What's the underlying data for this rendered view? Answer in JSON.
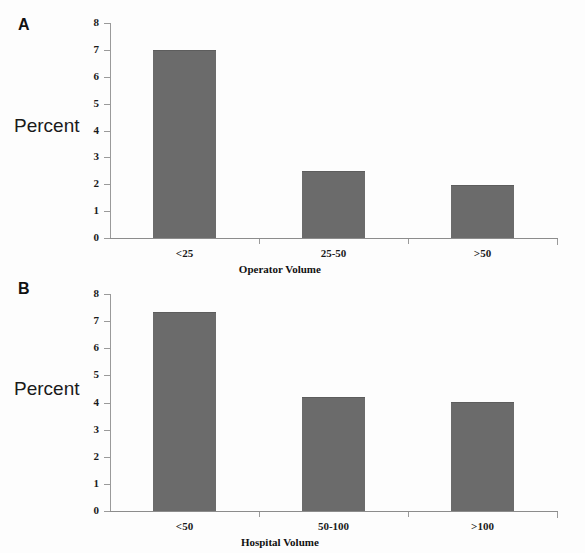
{
  "figure": {
    "panels": [
      {
        "letter": "A",
        "ylabel": "Percent",
        "xlabel": "Operator Volume",
        "yticks": [
          "0",
          "1",
          "2",
          "3",
          "4",
          "5",
          "6",
          "7",
          "8"
        ],
        "categories": [
          "<25",
          "25-50",
          ">50"
        ],
        "values": [
          6.95,
          2.45,
          1.93
        ]
      },
      {
        "letter": "B",
        "ylabel": "Percent",
        "xlabel": "Hospital Volume",
        "yticks": [
          "0",
          "1",
          "2",
          "3",
          "4",
          "5",
          "6",
          "7",
          "8"
        ],
        "categories": [
          "<50",
          "50-100",
          ">100"
        ],
        "values": [
          7.3,
          4.15,
          4.0
        ]
      }
    ],
    "bar_color": "#6b6b6b",
    "axis_color": "#9a9a9a"
  },
  "chart_data": [
    {
      "type": "bar",
      "title": "A",
      "categories": [
        "<25",
        "25-50",
        ">50"
      ],
      "values": [
        6.95,
        2.45,
        1.93
      ],
      "xlabel": "Operator Volume",
      "ylabel": "Percent",
      "ylim": [
        0,
        8
      ],
      "ytick_values": [
        0,
        1,
        2,
        3,
        4,
        5,
        6,
        7,
        8
      ],
      "grid": false,
      "legend": "none",
      "series": [
        {
          "name": "Percent",
          "values": [
            6.95,
            2.45,
            1.93
          ]
        }
      ]
    },
    {
      "type": "bar",
      "title": "B",
      "categories": [
        "<50",
        "50-100",
        ">100"
      ],
      "values": [
        7.3,
        4.15,
        4.0
      ],
      "xlabel": "Hospital Volume",
      "ylabel": "Percent",
      "ylim": [
        0,
        8
      ],
      "ytick_values": [
        0,
        1,
        2,
        3,
        4,
        5,
        6,
        7,
        8
      ],
      "grid": false,
      "legend": "none",
      "series": [
        {
          "name": "Percent",
          "values": [
            7.3,
            4.15,
            4.0
          ]
        }
      ]
    }
  ]
}
